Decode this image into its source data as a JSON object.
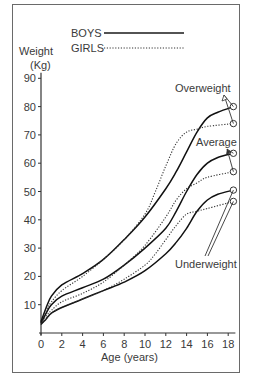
{
  "chart_data": {
    "type": "line",
    "title": "",
    "xlabel": "Age (years)",
    "ylabel": "Weight (Kg)",
    "ylabel_lines": [
      "Weight",
      "(Kg)"
    ],
    "xlim": [
      0,
      18.5
    ],
    "ylim": [
      0,
      92
    ],
    "x_ticks": [
      0,
      2,
      4,
      6,
      8,
      10,
      12,
      14,
      16,
      18
    ],
    "y_ticks": [
      10,
      20,
      30,
      40,
      50,
      60,
      70,
      80,
      90
    ],
    "grid": false,
    "legend": {
      "position": "top",
      "entries": [
        {
          "label": "BOYS",
          "style": "solid"
        },
        {
          "label": "GIRLS",
          "style": "dotted"
        }
      ]
    },
    "annotations": [
      {
        "text": "Overweight",
        "targets": [
          "boys_overweight",
          "girls_overweight"
        ]
      },
      {
        "text": "Average",
        "targets": [
          "boys_average",
          "girls_average"
        ]
      },
      {
        "text": "Underweight",
        "targets": [
          "boys_underweight",
          "girls_underweight"
        ]
      }
    ],
    "series": [
      {
        "id": "boys_overweight",
        "name": "Boys - Overweight",
        "style": "solid",
        "x": [
          0,
          0.5,
          1,
          2,
          4,
          6,
          8,
          10,
          12,
          13,
          14,
          15,
          16,
          17,
          18.5
        ],
        "y": [
          4,
          9,
          13,
          17,
          21,
          26,
          33,
          41,
          51,
          57,
          64,
          71,
          76,
          78,
          80
        ]
      },
      {
        "id": "girls_overweight",
        "name": "Girls - Overweight",
        "style": "dotted",
        "x": [
          0,
          0.5,
          1,
          2,
          4,
          6,
          8,
          10,
          11,
          12,
          13,
          14,
          15,
          16,
          18.5
        ],
        "y": [
          4,
          8,
          11,
          15,
          20,
          26,
          33,
          42,
          50,
          59,
          67,
          71,
          72,
          73,
          74
        ]
      },
      {
        "id": "boys_average",
        "name": "Boys - Average",
        "style": "solid",
        "x": [
          0,
          0.5,
          1,
          2,
          4,
          6,
          8,
          10,
          12,
          13,
          14,
          15,
          16,
          17,
          18.5
        ],
        "y": [
          3.5,
          7,
          10,
          13,
          16,
          19,
          24,
          30,
          37,
          43,
          50,
          56,
          60,
          62,
          63.5
        ]
      },
      {
        "id": "girls_average",
        "name": "Girls - Average",
        "style": "dotted",
        "x": [
          0,
          0.5,
          1,
          2,
          4,
          6,
          8,
          10,
          12,
          13,
          14,
          15,
          16,
          18.5
        ],
        "y": [
          3.5,
          6,
          8,
          11,
          14,
          18,
          24,
          31,
          41,
          47,
          51,
          53,
          55,
          57
        ]
      },
      {
        "id": "boys_underweight",
        "name": "Boys - Underweight",
        "style": "solid",
        "x": [
          0,
          0.5,
          1,
          2,
          4,
          6,
          8,
          10,
          12,
          13,
          14,
          15,
          16,
          17,
          18.5
        ],
        "y": [
          3,
          5,
          7,
          9,
          12,
          15,
          18,
          22,
          28,
          32,
          37,
          43,
          47,
          49,
          50.5
        ]
      },
      {
        "id": "girls_underweight",
        "name": "Girls - Underweight",
        "style": "dotted",
        "x": [
          0,
          0.5,
          1,
          2,
          4,
          6,
          8,
          10,
          11,
          12,
          13,
          14,
          15,
          16,
          18.5
        ],
        "y": [
          3,
          5,
          7,
          9,
          12,
          15,
          19,
          24,
          28,
          33,
          38,
          42,
          43,
          44,
          46.5
        ]
      }
    ]
  }
}
